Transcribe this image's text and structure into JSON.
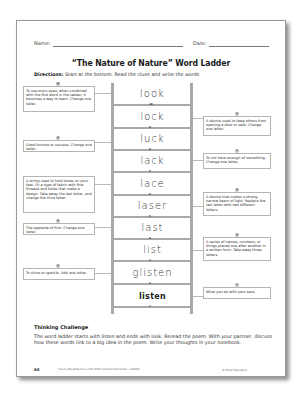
{
  "header": {
    "name_label": "Name:",
    "date_label": "Date:"
  },
  "title": "“The Nature of Nature” Word Ladder",
  "directions": {
    "label": "Directions:",
    "text": " Start at the bottom.  Read the clues and write the words."
  },
  "ladder": {
    "words": [
      {
        "num": "10",
        "word": "look"
      },
      {
        "num": "9",
        "word": "lock"
      },
      {
        "num": "8",
        "word": "luck"
      },
      {
        "num": "7",
        "word": "lack"
      },
      {
        "num": "6",
        "word": "lace"
      },
      {
        "num": "5",
        "word": "laser"
      },
      {
        "num": "4",
        "word": "last"
      },
      {
        "num": "3",
        "word": "list"
      },
      {
        "num": "2",
        "word": "glisten"
      },
      {
        "num": "1",
        "word": "listen"
      }
    ]
  },
  "clues": {
    "c10": {
      "num": "10",
      "text": "To use one's eyes; when combined with the first word in the ladder, it becomes a way to learn. Change one letter."
    },
    "c9": {
      "num": "9",
      "text": "A device used to keep others from opening a door or safe.  Change one letter."
    },
    "c8": {
      "num": "8",
      "text": "Good fortune or success. Change one letter."
    },
    "c7": {
      "num": "7",
      "text": "To not have enough of something.  Change one letter."
    },
    "c6": {
      "num": "6",
      "text": "A string used to hold shoes on your feet.  Or a type of fabric with fine threads and holes that make a design.  Take away the last letter, and change the third letter."
    },
    "c5": {
      "num": "5",
      "text": "A device that makes a strong, narrow beam of light.  Replace the last letter with two different letters."
    },
    "c4": {
      "num": "4",
      "text": "The opposite of first. Change one letter."
    },
    "c3": {
      "num": "3",
      "text": "A series of names, numbers, or things placed one after another in a written form.  Take away three letters."
    },
    "c2": {
      "num": "2",
      "text": "To shine or sparkle.  Add one letter."
    },
    "c1": {
      "num": "1",
      "text": "What you do with your ears."
    }
  },
  "thinking_challenge": {
    "heading": "Thinking Challenge",
    "body": "The word ladder starts with listen and ends with look.  Reread the poem.  With your partner, discuss how these words link to a big idea in the poem.  Write your thoughts in your notebook."
  },
  "footer": {
    "page_number": "64",
    "book": "Fluency/Reading Clues with Differentiated Instruction—118001",
    "copyright": "© Shell Education"
  },
  "colors": {
    "rail": "#a9a9a9",
    "badge": "#bdbdbd",
    "clue_border": "#b5b5b5"
  }
}
